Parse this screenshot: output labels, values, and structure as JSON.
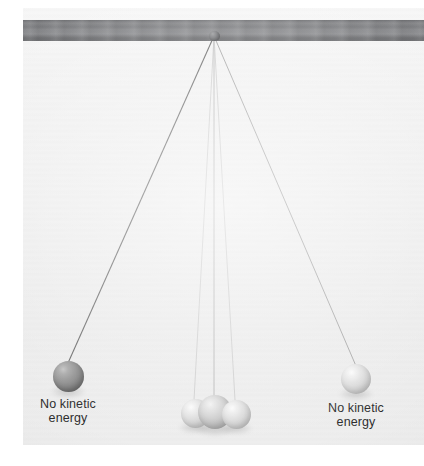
{
  "figure": {
    "type": "physics-diagram"
  },
  "support_bar": {
    "name": "support-bar",
    "color": "#7d7e81"
  },
  "pivot": {
    "name": "pivot-knob",
    "color": "#4e4f52",
    "x": 191,
    "y": 28
  },
  "labels": {
    "left": "No kinetic\nenergy",
    "right": "No kinetic\nenergy"
  },
  "strings": [
    {
      "name": "string-left-extreme",
      "x1": 191,
      "y1": 28,
      "x2": 45,
      "y2": 355,
      "color": "#6a6a6a",
      "width": 1.1
    },
    {
      "name": "string-center-a",
      "x1": 191,
      "y1": 28,
      "x2": 171,
      "y2": 392,
      "color": "#c8c8c8",
      "width": 0.8
    },
    {
      "name": "string-center-b",
      "x1": 191,
      "y1": 28,
      "x2": 191,
      "y2": 396,
      "color": "#b4b4b4",
      "width": 0.9
    },
    {
      "name": "string-center-c",
      "x1": 191,
      "y1": 28,
      "x2": 212,
      "y2": 392,
      "color": "#c8c8c8",
      "width": 0.8
    },
    {
      "name": "string-right-extreme",
      "x1": 191,
      "y1": 28,
      "x2": 333,
      "y2": 358,
      "color": "#a8a8a8",
      "width": 1.0
    }
  ],
  "balls": [
    {
      "name": "ball-left-extreme",
      "cx": 45,
      "cy": 368,
      "r": 15.5,
      "shade": "dark",
      "color": "#808080"
    },
    {
      "name": "ball-center-left",
      "cx": 172,
      "cy": 405,
      "r": 14.5,
      "shade": "light",
      "color": "#d2d2d2"
    },
    {
      "name": "ball-center-middle",
      "cx": 192,
      "cy": 404,
      "r": 17.0,
      "shade": "mid",
      "color": "#bfbfbf"
    },
    {
      "name": "ball-center-right",
      "cx": 213,
      "cy": 406,
      "r": 14.5,
      "shade": "light",
      "color": "#d2d2d2"
    },
    {
      "name": "ball-right-extreme",
      "cx": 333,
      "cy": 371,
      "r": 15.0,
      "shade": "light",
      "color": "#d2d2d2"
    }
  ],
  "caption_positions": {
    "left": {
      "x": 45,
      "y": 389
    },
    "right": {
      "x": 333,
      "y": 393
    }
  },
  "colors": {
    "paper": "#efefef",
    "page_white": "#ffffff",
    "bar": "#7d7e81",
    "text": "#2e2e2e",
    "ball_dark": "#808080",
    "ball_light": "#d2d2d2"
  }
}
